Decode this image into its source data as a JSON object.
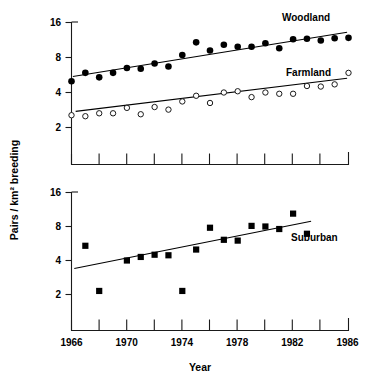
{
  "figure": {
    "axis_y_title": "Pairs / km² breeding",
    "axis_x_title": "Year"
  },
  "chart_data": [
    {
      "type": "scatter",
      "panel": "top",
      "title": "",
      "xlabel": "Year",
      "ylabel": "Pairs / km² breeding",
      "xlim": [
        1966,
        1986
      ],
      "ylim": [
        1.0,
        16.0
      ],
      "yscale": "log2",
      "grid": false,
      "legend_position": "inline-right",
      "xticks": [
        1966,
        1968,
        1970,
        1972,
        1974,
        1976,
        1978,
        1980,
        1982,
        1984,
        1986
      ],
      "xticklabels": [
        "1966",
        "",
        "1970",
        "",
        "1974",
        "",
        "1978",
        "",
        "1982",
        "",
        "1986"
      ],
      "yticks": [
        2,
        4,
        8,
        16
      ],
      "yticklabels": [
        "2",
        "4",
        "8",
        "16"
      ],
      "series": [
        {
          "name": "Woodland",
          "marker": "filled-circle",
          "x": [
            1966,
            1967,
            1968,
            1969,
            1970,
            1971,
            1972,
            1973,
            1974,
            1975,
            1976,
            1977,
            1978,
            1979,
            1980,
            1981,
            1982,
            1983,
            1984,
            1985,
            1986
          ],
          "values": [
            5.0,
            5.9,
            5.4,
            5.9,
            6.5,
            6.4,
            7.1,
            6.7,
            8.4,
            10.8,
            9.2,
            10.3,
            9.9,
            9.9,
            10.6,
            9.6,
            11.5,
            11.6,
            11.2,
            11.7,
            11.8
          ],
          "trend": {
            "x": [
              1966.1,
              1985.9
            ],
            "y": [
              5.5,
              13.2
            ]
          }
        },
        {
          "name": "Farmland",
          "marker": "open-circle",
          "x": [
            1966,
            1967,
            1968,
            1969,
            1970,
            1971,
            1972,
            1973,
            1974,
            1975,
            1976,
            1977,
            1978,
            1979,
            1980,
            1981,
            1982,
            1983,
            1984,
            1985,
            1986
          ],
          "values": [
            2.55,
            2.5,
            2.65,
            2.65,
            2.95,
            2.6,
            3.0,
            2.85,
            3.35,
            3.75,
            3.25,
            4.0,
            4.1,
            3.65,
            4.0,
            3.9,
            3.9,
            4.55,
            4.5,
            4.7,
            5.9
          ],
          "trend": {
            "x": [
              1966.3,
              1985.9
            ],
            "y": [
              2.75,
              5.3
            ]
          }
        }
      ]
    },
    {
      "type": "scatter",
      "panel": "bottom",
      "title": "",
      "xlabel": "Year",
      "ylabel": "Pairs / km² breeding",
      "xlim": [
        1966,
        1986
      ],
      "ylim": [
        1.0,
        16.0
      ],
      "yscale": "log2",
      "grid": false,
      "legend_position": "inline-right",
      "xticks": [
        1966,
        1968,
        1970,
        1972,
        1974,
        1976,
        1978,
        1980,
        1982,
        1984,
        1986
      ],
      "xticklabels": [
        "1966",
        "",
        "1970",
        "",
        "1974",
        "",
        "1978",
        "",
        "1982",
        "",
        "1986"
      ],
      "yticks": [
        2,
        4,
        8,
        16
      ],
      "yticklabels": [
        "2",
        "4",
        "8",
        "16"
      ],
      "series": [
        {
          "name": "Suburban",
          "marker": "filled-square",
          "x": [
            1967,
            1968,
            1970,
            1971,
            1972,
            1973,
            1974,
            1975,
            1976,
            1977,
            1978,
            1979,
            1980,
            1981,
            1982,
            1983
          ],
          "values": [
            5.4,
            2.15,
            4.0,
            4.3,
            4.5,
            4.45,
            2.15,
            5.0,
            7.8,
            6.1,
            6.0,
            8.1,
            8.0,
            7.6,
            10.4,
            6.9
          ],
          "trend": {
            "x": [
              1966.2,
              1983.3
            ],
            "y": [
              3.4,
              8.9
            ]
          }
        }
      ]
    }
  ]
}
